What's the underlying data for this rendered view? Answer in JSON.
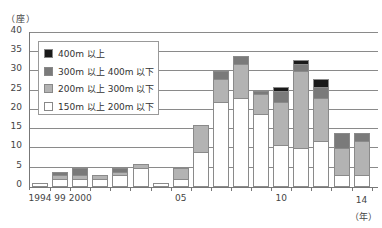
{
  "chart_data": {
    "type": "bar",
    "stacked": true,
    "title": "",
    "ylabel": "（座）",
    "xlabel": "（年）",
    "ylim": [
      0,
      40
    ],
    "yticks": [
      0,
      5,
      10,
      15,
      20,
      25,
      30,
      35,
      40
    ],
    "grid": true,
    "legend_position": "upper-left-inside",
    "categories": [
      "1994",
      "1999",
      "2000",
      "2001",
      "2002",
      "2003",
      "2004",
      "2005",
      "2006",
      "2007",
      "2008",
      "2009",
      "2010",
      "2011",
      "2012",
      "2013",
      "2014"
    ],
    "xtick_labels": [
      {
        "index": 0,
        "label": "1994"
      },
      {
        "index": 1,
        "label": "99"
      },
      {
        "index": 2,
        "label": "2000"
      },
      {
        "index": 7,
        "label": "05"
      },
      {
        "index": 12,
        "label": "10"
      },
      {
        "index": 16,
        "label": "14"
      }
    ],
    "series": [
      {
        "name": "150m 以上 200m 以下",
        "color": "#ffffff",
        "values": [
          1,
          2,
          2,
          2,
          3,
          5,
          1,
          2,
          9,
          22,
          23,
          19,
          11,
          10,
          12,
          3,
          3
        ]
      },
      {
        "name": "200m 以上 300m 以下",
        "color": "#b3b3b3",
        "values": [
          0,
          1,
          1,
          1,
          1,
          1,
          0,
          3,
          7,
          6,
          9,
          5,
          11,
          20,
          11,
          7,
          9
        ]
      },
      {
        "name": "300m 以上 400m 以下",
        "color": "#7a7a7a",
        "values": [
          0,
          1,
          2,
          0,
          1,
          0,
          0,
          0,
          0,
          2,
          2,
          1,
          3,
          2,
          3,
          4,
          2
        ]
      },
      {
        "name": "400m 以上",
        "color": "#1a1a1a",
        "values": [
          0,
          0,
          0,
          0,
          0,
          0,
          0,
          0,
          0,
          0,
          0,
          0,
          1,
          1,
          2,
          0,
          0
        ]
      }
    ],
    "totals": [
      1,
      4,
      5,
      3,
      5,
      6,
      1,
      5,
      16,
      30,
      34,
      25,
      26,
      33,
      28,
      14,
      14
    ]
  },
  "axis": {
    "y_unit": "（座）",
    "x_unit": "（年）"
  },
  "legend": {
    "items": [
      {
        "label": "400m 以上",
        "color": "#1a1a1a"
      },
      {
        "label": "300m 以上 400m 以下",
        "color": "#7a7a7a"
      },
      {
        "label": "200m 以上 300m 以下",
        "color": "#b3b3b3"
      },
      {
        "label": "150m 以上 200m 以下",
        "color": "#ffffff"
      }
    ]
  }
}
